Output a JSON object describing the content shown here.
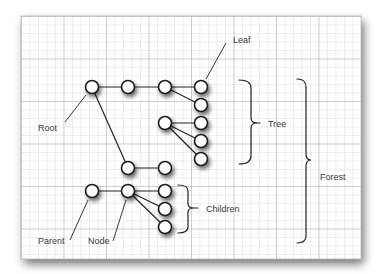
{
  "diagram": {
    "type": "tree-terminology",
    "labels": {
      "leaf": "Leaf",
      "root": "Root",
      "tree": "Tree",
      "forest": "Forest",
      "children": "Children",
      "parent": "Parent",
      "node": "Node"
    },
    "nodes": [
      {
        "id": "root",
        "x": 92,
        "y": 87
      },
      {
        "id": "n2",
        "x": 128,
        "y": 87
      },
      {
        "id": "n3",
        "x": 165,
        "y": 87
      },
      {
        "id": "leaf1",
        "x": 201,
        "y": 87
      },
      {
        "id": "leaf2",
        "x": 201,
        "y": 105
      },
      {
        "id": "sub",
        "x": 165,
        "y": 123
      },
      {
        "id": "leaf3",
        "x": 201,
        "y": 123
      },
      {
        "id": "leaf4",
        "x": 201,
        "y": 141
      },
      {
        "id": "leaf5",
        "x": 201,
        "y": 159
      },
      {
        "id": "low1",
        "x": 128,
        "y": 168
      },
      {
        "id": "low2",
        "x": 165,
        "y": 168
      },
      {
        "id": "parent",
        "x": 92,
        "y": 191
      },
      {
        "id": "node",
        "x": 128,
        "y": 191
      },
      {
        "id": "child1",
        "x": 165,
        "y": 191
      },
      {
        "id": "child2",
        "x": 165,
        "y": 209
      },
      {
        "id": "child3",
        "x": 165,
        "y": 227
      }
    ],
    "edges": [
      [
        "root",
        "n2"
      ],
      [
        "n2",
        "n3"
      ],
      [
        "n3",
        "leaf1"
      ],
      [
        "n3",
        "leaf2"
      ],
      [
        "sub",
        "leaf3"
      ],
      [
        "sub",
        "leaf4"
      ],
      [
        "sub",
        "leaf5"
      ],
      [
        "root",
        "low1"
      ],
      [
        "low1",
        "low2"
      ],
      [
        "parent",
        "node"
      ],
      [
        "node",
        "child1"
      ],
      [
        "node",
        "child2"
      ],
      [
        "node",
        "child3"
      ]
    ],
    "colors": {
      "paper": "#ffffff",
      "grid_minor": "#d4d4d4",
      "grid_major": "#a8a8a8",
      "ink": "#222222",
      "label": "#3a3a3a",
      "shadow": "#8c8c8c"
    }
  }
}
